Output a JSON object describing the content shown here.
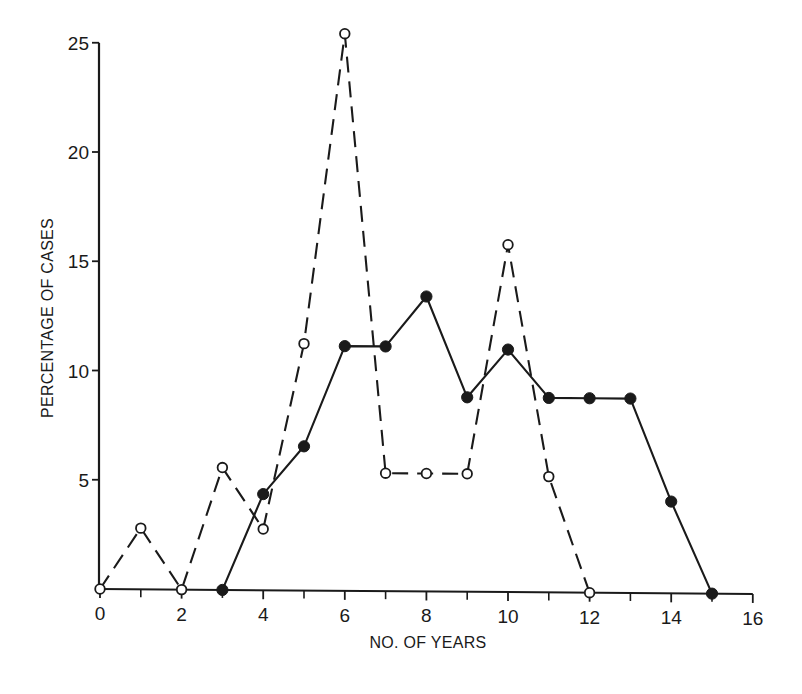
{
  "chart_data": {
    "type": "line",
    "title": "",
    "xlabel": "NO. OF YEARS",
    "ylabel": "PERCENTAGE OF CASES",
    "xlim": [
      0,
      16
    ],
    "ylim": [
      0,
      25
    ],
    "x_ticks_major": [
      0,
      2,
      4,
      6,
      8,
      10,
      12,
      14,
      16
    ],
    "x_ticks_minor": [
      1,
      3,
      5,
      7,
      9,
      11,
      13,
      15
    ],
    "x_tick_labels": [
      "0",
      "2",
      "4",
      "6",
      "8",
      "10",
      "12",
      "14",
      "16"
    ],
    "y_ticks": [
      5,
      10,
      15,
      20,
      25
    ],
    "y_tick_labels": [
      "5",
      "10",
      "15",
      "20",
      "25"
    ],
    "grid": false,
    "legend": null,
    "series": [
      {
        "name": "open circles (dashed)",
        "marker": "open-circle",
        "line_style": "dashed",
        "x": [
          0,
          1,
          2,
          3,
          4,
          5,
          6,
          7,
          8,
          9,
          10,
          11,
          12
        ],
        "values": [
          0,
          2.8,
          0,
          5.6,
          2.8,
          11.3,
          25.5,
          5.4,
          5.4,
          5.4,
          15.9,
          5.3,
          0
        ]
      },
      {
        "name": "filled circles (solid)",
        "marker": "filled-circle",
        "line_style": "solid",
        "x": [
          3,
          4,
          5,
          6,
          7,
          8,
          9,
          10,
          11,
          12,
          13,
          14,
          15
        ],
        "values": [
          0,
          4.4,
          6.6,
          11.2,
          11.2,
          13.5,
          8.9,
          11.1,
          8.9,
          8.9,
          8.9,
          4.2,
          0
        ]
      }
    ]
  },
  "colors": {
    "ink": "#1a1a1a",
    "background": "#ffffff"
  }
}
